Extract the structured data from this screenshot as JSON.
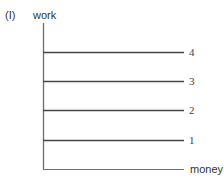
{
  "figure": {
    "panel_label": "(I)",
    "y_axis_label": "work",
    "x_axis_label": "money"
  },
  "lines": [
    {
      "label": "4",
      "y": 52
    },
    {
      "label": "3",
      "y": 81
    },
    {
      "label": "2",
      "y": 110
    },
    {
      "label": "1",
      "y": 140
    }
  ],
  "colors": {
    "axis": "#6e6e6e",
    "line": "#444444",
    "text": "#333333"
  }
}
